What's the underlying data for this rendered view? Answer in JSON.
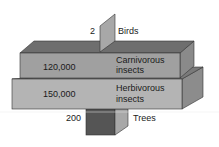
{
  "diagram": {
    "type": "pyramid of numbers",
    "levels": [
      {
        "name": "Birds",
        "count": "2"
      },
      {
        "name_line1": "Carnivorous",
        "name_line2": "insects",
        "count": "120,000"
      },
      {
        "name_line1": "Herbivorous",
        "name_line2": "insects",
        "count": "150,000"
      },
      {
        "name": "Trees",
        "count": "200"
      }
    ],
    "colors": {
      "birds": "#a8a8a8",
      "carnivorous_front": "#a0a0a0",
      "carnivorous_top": "#6e6e6e",
      "herbivorous_front": "#b4b4b4",
      "trees_front": "#555555",
      "trees_side": "#a8a8a8"
    }
  }
}
